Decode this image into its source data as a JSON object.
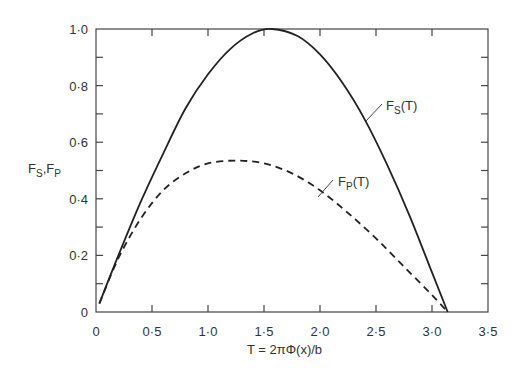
{
  "chart_data": {
    "type": "line",
    "title": "",
    "xlabel": "T = 2πΦ(x)/b",
    "ylabel": "F_S, F_P",
    "xlim": [
      0,
      3.5
    ],
    "ylim": [
      0,
      1.0
    ],
    "x_ticks": [
      "0",
      "0·5",
      "1·0",
      "1·5",
      "2·0",
      "2·5",
      "3·0",
      "3·5"
    ],
    "y_ticks": [
      "0",
      "0·2",
      "0·4",
      "0·6",
      "0·8",
      "1·0"
    ],
    "grid": false,
    "legend": "inline labels with leader lines",
    "series": [
      {
        "name": "F_S(T)",
        "style": "solid",
        "x": [
          0.03,
          0.2,
          0.4,
          0.6,
          0.8,
          1.0,
          1.2,
          1.4,
          1.57,
          1.8,
          2.0,
          2.2,
          2.4,
          2.6,
          2.8,
          3.0,
          3.14
        ],
        "y": [
          0.03,
          0.2,
          0.39,
          0.56,
          0.72,
          0.84,
          0.93,
          0.985,
          1.0,
          0.975,
          0.91,
          0.81,
          0.68,
          0.52,
          0.34,
          0.14,
          0.0
        ]
      },
      {
        "name": "F_P(T)",
        "style": "dashed",
        "x": [
          0.03,
          0.2,
          0.4,
          0.6,
          0.8,
          1.0,
          1.25,
          1.5,
          1.75,
          2.0,
          2.25,
          2.5,
          2.75,
          3.0,
          3.14
        ],
        "y": [
          0.03,
          0.19,
          0.33,
          0.43,
          0.49,
          0.525,
          0.535,
          0.525,
          0.49,
          0.43,
          0.35,
          0.26,
          0.16,
          0.06,
          0.0
        ]
      }
    ],
    "annotations": [
      {
        "text": "F_S(T)",
        "x": 2.2,
        "y": 0.8
      },
      {
        "text": "F_P(T)",
        "x": 2.05,
        "y": 0.42
      }
    ]
  },
  "labels": {
    "y_axis_main": "F",
    "y_axis_sub1": "S",
    "y_axis_sep": ",F",
    "y_axis_sub2": "P",
    "x_axis": "T = 2πΦ(x)/b",
    "fs_main": "F",
    "fs_sub": "S",
    "fs_arg": "(T)",
    "fp_main": "F",
    "fp_sub": "P",
    "fp_arg": "(T)"
  }
}
